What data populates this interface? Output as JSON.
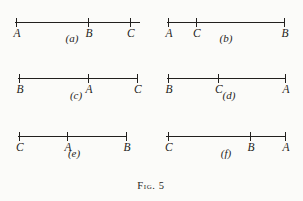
{
  "figure": {
    "caption": "Fig. 5",
    "caption_word": "Fig.",
    "caption_number": "5",
    "background_color": "#fbfbf9",
    "ink_color": "#22201e"
  },
  "panels": [
    {
      "id": "a",
      "caption": "(a)",
      "line": {
        "x": 15,
        "y": 14,
        "width": 125
      },
      "points": [
        {
          "label": "A",
          "x": 16
        },
        {
          "label": "B",
          "x": 88
        },
        {
          "label": "C",
          "x": 130
        }
      ]
    },
    {
      "id": "b",
      "caption": "(b)",
      "line": {
        "x": 167,
        "y": 14,
        "width": 118
      },
      "points": [
        {
          "label": "A",
          "x": 168
        },
        {
          "label": "C",
          "x": 196
        },
        {
          "label": "B",
          "x": 284
        }
      ]
    },
    {
      "id": "c",
      "caption": "(c)",
      "line": {
        "x": 18,
        "y": 70,
        "width": 120
      },
      "points": [
        {
          "label": "B",
          "x": 19
        },
        {
          "label": "A",
          "x": 88
        },
        {
          "label": "C",
          "x": 137
        }
      ]
    },
    {
      "id": "d",
      "caption": "(d)",
      "line": {
        "x": 167,
        "y": 70,
        "width": 119
      },
      "points": [
        {
          "label": "B",
          "x": 168
        },
        {
          "label": "C",
          "x": 218
        },
        {
          "label": "A",
          "x": 285
        }
      ]
    },
    {
      "id": "e",
      "caption": "(e)",
      "line": {
        "x": 18,
        "y": 128,
        "width": 109
      },
      "points": [
        {
          "label": "C",
          "x": 19
        },
        {
          "label": "A",
          "x": 67
        },
        {
          "label": "B",
          "x": 126
        }
      ]
    },
    {
      "id": "f",
      "caption": "(f)",
      "line": {
        "x": 166,
        "y": 128,
        "width": 120
      },
      "points": [
        {
          "label": "C",
          "x": 168
        },
        {
          "label": "B",
          "x": 250
        },
        {
          "label": "A",
          "x": 285
        }
      ]
    }
  ],
  "panel_captions": [
    {
      "id": "a",
      "text": "(a)",
      "x": 72,
      "y": 32
    },
    {
      "id": "b",
      "text": "(b)",
      "x": 226,
      "y": 32
    },
    {
      "id": "c",
      "text": "(c)",
      "x": 76,
      "y": 89
    },
    {
      "id": "d",
      "text": "(d)",
      "x": 229,
      "y": 89
    },
    {
      "id": "e",
      "text": "(e)",
      "x": 74,
      "y": 147
    },
    {
      "id": "f",
      "text": "(f)",
      "x": 226,
      "y": 147
    }
  ]
}
